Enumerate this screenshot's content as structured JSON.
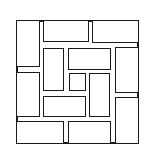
{
  "diagram": {
    "title": "",
    "stroke_color": "#1a1a1a",
    "fill_color": "#ffffff",
    "frame": {
      "x": 16,
      "y": 20,
      "w": 123,
      "h": 124
    },
    "tiles": [
      {
        "id": "top-left-vertical",
        "x": 16,
        "y": 20,
        "w": 24,
        "h": 47
      },
      {
        "id": "top-middle-horizontal",
        "x": 43,
        "y": 20,
        "w": 46,
        "h": 22
      },
      {
        "id": "top-right-horizontal",
        "x": 92,
        "y": 20,
        "w": 47,
        "h": 23
      },
      {
        "id": "left-middle-vertical",
        "x": 16,
        "y": 72,
        "w": 24,
        "h": 45
      },
      {
        "id": "inner-left-vertical",
        "x": 43,
        "y": 48,
        "w": 21,
        "h": 43
      },
      {
        "id": "inner-top-horizontal",
        "x": 68,
        "y": 48,
        "w": 43,
        "h": 22
      },
      {
        "id": "center-square",
        "x": 69,
        "y": 73,
        "w": 17,
        "h": 18
      },
      {
        "id": "inner-right-vertical",
        "x": 89,
        "y": 73,
        "w": 21,
        "h": 44
      },
      {
        "id": "right-upper-vertical",
        "x": 115,
        "y": 47,
        "w": 24,
        "h": 46
      },
      {
        "id": "inner-bottom-horizontal",
        "x": 43,
        "y": 96,
        "w": 43,
        "h": 21
      },
      {
        "id": "right-lower-vertical",
        "x": 115,
        "y": 97,
        "w": 24,
        "h": 47
      },
      {
        "id": "bottom-left-horizontal",
        "x": 16,
        "y": 121,
        "w": 48,
        "h": 23
      },
      {
        "id": "bottom-middle-horizontal",
        "x": 68,
        "y": 121,
        "w": 43,
        "h": 23
      }
    ]
  }
}
